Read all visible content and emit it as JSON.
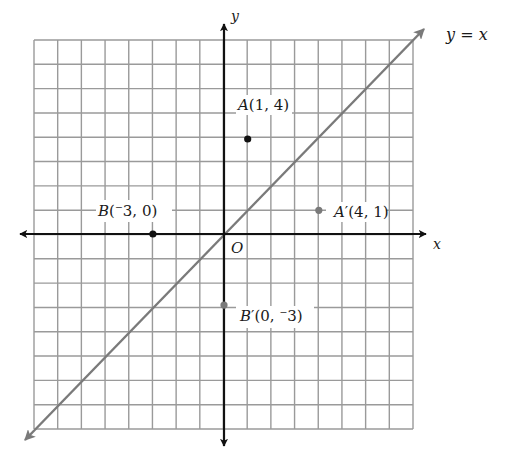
{
  "figure": {
    "title_line_label": "y = x",
    "axes": {
      "x_label": "x",
      "y_label": "y",
      "origin_label": "O",
      "x_range": [
        -8,
        8
      ],
      "y_range": [
        -8,
        8
      ],
      "grid": true,
      "grid_step": 1
    },
    "line": {
      "equation": "y = x",
      "label_var_left": "y",
      "label_eq": " = ",
      "label_var_right": "x",
      "color": "#7a7a7a"
    },
    "points": [
      {
        "name": "A",
        "prime": "",
        "x": 1,
        "y": 4,
        "coords_text": "(1, 4)",
        "color": "#111111"
      },
      {
        "name": "B",
        "prime": "",
        "x": -3,
        "y": 0,
        "coords_text_open": "(",
        "neg": "⁻3",
        "coords_text_rest": ", 0)",
        "color": "#111111"
      },
      {
        "name": "A",
        "prime": "′",
        "x": 4,
        "y": 1,
        "coords_text": "(4, 1)",
        "color": "#7a7a7a"
      },
      {
        "name": "B",
        "prime": "′",
        "x": 0,
        "y": -3,
        "coords_text_open": "(0, ",
        "neg": "⁻3",
        "coords_text_rest": ")",
        "color": "#7a7a7a"
      }
    ],
    "colors": {
      "grid": "#9a9a9a",
      "axis": "#111111",
      "reflection": "#7a7a7a"
    }
  },
  "chart_data": {
    "type": "scatter",
    "title": "",
    "xlabel": "x",
    "ylabel": "y",
    "xlim": [
      -8,
      8
    ],
    "ylim": [
      -8,
      8
    ],
    "grid": true,
    "series": [
      {
        "name": "original",
        "points": [
          {
            "label": "A(1, 4)",
            "x": 1,
            "y": 4
          },
          {
            "label": "B(⁻3, 0)",
            "x": -3,
            "y": 0
          }
        ]
      },
      {
        "name": "reflected",
        "points": [
          {
            "label": "A′(4, 1)",
            "x": 4,
            "y": 1
          },
          {
            "label": "B′(0, ⁻3)",
            "x": 0,
            "y": -3
          }
        ]
      }
    ],
    "lines": [
      {
        "label": "y = x",
        "slope": 1,
        "intercept": 0
      }
    ],
    "annotations": [
      "O"
    ]
  }
}
